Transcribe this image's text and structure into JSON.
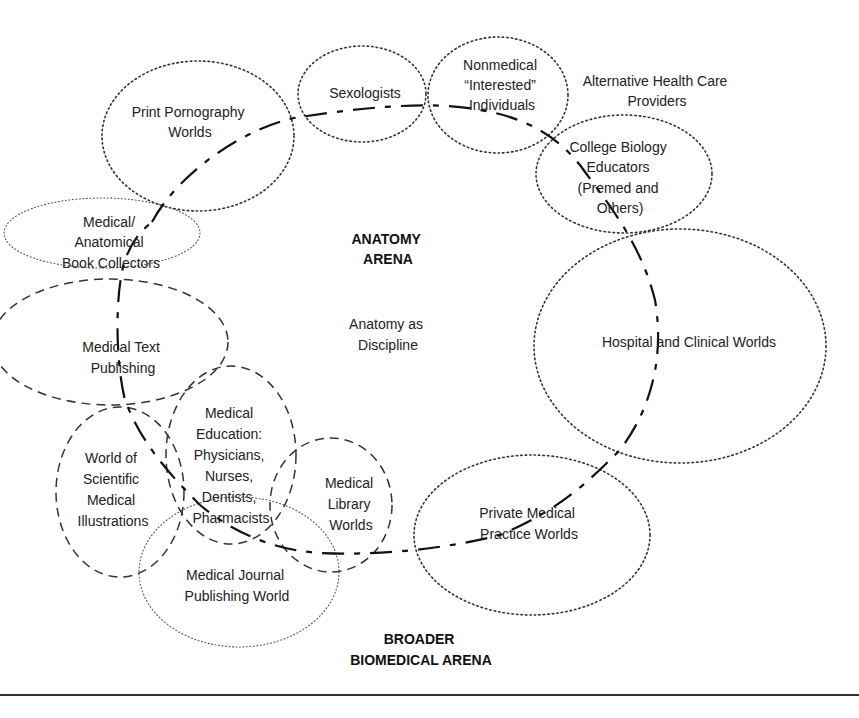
{
  "diagram": {
    "arenas": {
      "anatomy": {
        "line1": "ANATOMY",
        "line2": "ARENA"
      },
      "broader": {
        "line1": "BROADER",
        "line2": "BIOMEDICAL ARENA"
      },
      "center_label": {
        "line1": "Anatomy as",
        "line2": "Discipline"
      }
    },
    "worlds": {
      "print_pornography": {
        "lines": [
          "Print Pornography",
          "Worlds"
        ],
        "style": "dotted"
      },
      "sexologists": {
        "lines": [
          "Sexologists"
        ],
        "style": "dotted"
      },
      "nonmedical": {
        "lines": [
          "Nonmedical",
          "“Interested”",
          "Individuals"
        ],
        "style": "dotted"
      },
      "alternative": {
        "lines": [
          "Alternative Health Care",
          "Providers"
        ],
        "style": "none"
      },
      "college_biology": {
        "lines": [
          "College Biology",
          "Educators",
          "(Premed and",
          "Others)"
        ],
        "style": "dotted"
      },
      "book_collectors": {
        "lines": [
          "Medical/",
          "Anatomical",
          "Book Collectors"
        ],
        "style": "dotted-light"
      },
      "medical_text": {
        "lines": [
          "Medical Text",
          "Publishing"
        ],
        "style": "dashed"
      },
      "hospital": {
        "lines": [
          "Hospital and Clinical Worlds"
        ],
        "style": "dotted"
      },
      "scientific_illustrations": {
        "lines": [
          "World of",
          "Scientific",
          "Medical",
          "Illustrations"
        ],
        "style": "dashed"
      },
      "medical_education": {
        "lines": [
          "Medical",
          "Education:",
          "Physicians,",
          "Nurses,",
          "Dentists,",
          "Pharmacists"
        ],
        "style": "dashed"
      },
      "medical_library": {
        "lines": [
          "Medical",
          "Library",
          "Worlds"
        ],
        "style": "dashed"
      },
      "private_practice": {
        "lines": [
          "Private Medical",
          "Practice Worlds"
        ],
        "style": "dotted"
      },
      "journal_publishing": {
        "lines": [
          "Medical Journal",
          "Publishing World"
        ],
        "style": "dotted-light"
      }
    },
    "boundary": {
      "style": "dash-dot",
      "description": "Anatomy arena boundary"
    }
  }
}
